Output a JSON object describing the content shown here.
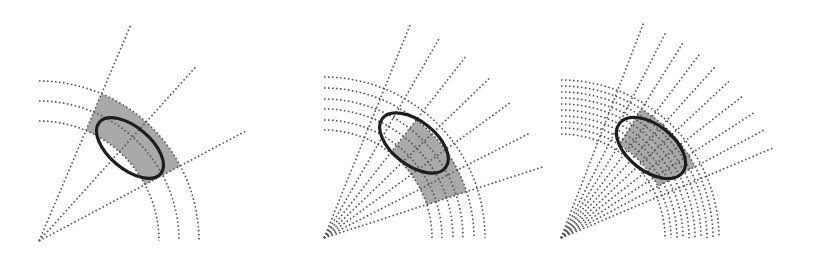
{
  "figure": {
    "region_fill": "#a9a9a9",
    "ellipse_stroke": "#1e1e1e",
    "grid_stroke": "#555555"
  },
  "panels": [
    {
      "name": "coarse-grid",
      "origin": [
        39,
        241
      ],
      "ray_angles_deg": [
        67,
        48,
        28
      ],
      "ray_length": 235,
      "arc_radii": [
        120,
        140,
        160
      ],
      "arc_span_deg": [
        0,
        90
      ],
      "region": {
        "r_min": 120,
        "r_max": 160,
        "a_min": 28,
        "a_max": 67
      },
      "ellipse": {
        "cx": 130,
        "cy": 148,
        "rx": 40,
        "ry": 21,
        "rotate": 40
      },
      "white_notch": true
    },
    {
      "name": "medium-grid",
      "origin": [
        324,
        238
      ],
      "ray_angles_deg": [
        68,
        60,
        52,
        44,
        36,
        27,
        18
      ],
      "ray_length": 232,
      "arc_radii": [
        108,
        118,
        129,
        139,
        150,
        161
      ],
      "arc_span_deg": [
        0,
        90
      ],
      "region": {
        "r_min": 108,
        "r_max": 150,
        "a_min": 18,
        "a_max": 52
      },
      "ellipse": {
        "cx": 414,
        "cy": 143,
        "rx": 40,
        "ry": 22,
        "rotate": 38
      },
      "white_notch": true
    },
    {
      "name": "fine-grid",
      "origin": [
        561,
        238
      ],
      "ray_angles_deg": [
        69,
        63,
        58,
        53,
        48,
        43,
        38,
        33,
        28,
        23
      ],
      "ray_length": 230,
      "arc_radii": [
        104,
        110,
        116,
        122,
        128,
        134,
        140,
        146,
        152,
        158
      ],
      "arc_span_deg": [
        0,
        90
      ],
      "region": {
        "r_min": 110,
        "r_max": 152,
        "a_min": 28,
        "a_max": 58
      },
      "ellipse": {
        "cx": 651,
        "cy": 148,
        "rx": 40,
        "ry": 23,
        "rotate": 38
      },
      "white_notch": false
    }
  ]
}
